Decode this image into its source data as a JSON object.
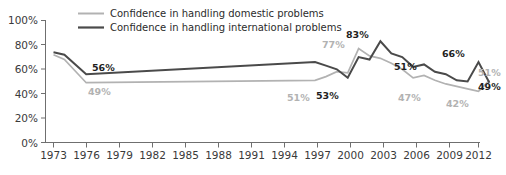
{
  "chart_data": {
    "type": "line",
    "title": "",
    "subtitle": "",
    "xlabel": "",
    "ylabel": "",
    "xlim": [
      1973,
      2013
    ],
    "ylim": [
      0,
      100
    ],
    "grid": false,
    "legend_position": "top-center",
    "ytick_labels": [
      "0%",
      "20%",
      "40%",
      "60%",
      "80%",
      "100%"
    ],
    "ytick_values": [
      0,
      20,
      40,
      60,
      80,
      100
    ],
    "xtick_labels": [
      "1973",
      "1976",
      "1979",
      "1982",
      "1985",
      "1988",
      "1991",
      "1994",
      "1997",
      "2000",
      "2003",
      "2006",
      "2009",
      "2012"
    ],
    "xtick_values": [
      1973,
      1976,
      1979,
      1982,
      1985,
      1988,
      1991,
      1994,
      1997,
      2000,
      2003,
      2006,
      2009,
      2012
    ],
    "series": [
      {
        "name": "Confidence in handling domestic problems",
        "color": "#b2b2b2",
        "x": [
          1973,
          1974,
          1976,
          1997,
          1998,
          1999,
          2000,
          2001,
          2002,
          2003,
          2004,
          2005,
          2006,
          2007,
          2008,
          2009,
          2010,
          2011,
          2012,
          2013
        ],
        "values": [
          72,
          68,
          49,
          51,
          54,
          58,
          57,
          77,
          71,
          69,
          65,
          60,
          53,
          55,
          51,
          48,
          46,
          44,
          42,
          51
        ]
      },
      {
        "name": "Confidence in handling international problems",
        "color": "#4a4a4a",
        "x": [
          1973,
          1974,
          1976,
          1997,
          1998,
          1999,
          2000,
          2001,
          2002,
          2003,
          2004,
          2005,
          2006,
          2007,
          2008,
          2009,
          2010,
          2011,
          2012,
          2013
        ],
        "values": [
          74,
          72,
          56,
          66,
          63,
          60,
          53,
          70,
          68,
          83,
          73,
          70,
          62,
          64,
          58,
          56,
          51,
          50,
          66,
          49
        ]
      }
    ],
    "annotations": [
      {
        "text": "56%",
        "series": "international",
        "year": 1976,
        "value": 56,
        "style": "dark"
      },
      {
        "text": "49%",
        "series": "domestic",
        "year": 1976,
        "value": 49,
        "style": "light"
      },
      {
        "text": "51%",
        "series": "domestic",
        "year": 1997,
        "value": 51,
        "style": "light"
      },
      {
        "text": "53%",
        "series": "international",
        "year": 2000,
        "value": 53,
        "style": "dark"
      },
      {
        "text": "77%",
        "series": "domestic",
        "year": 2001,
        "value": 77,
        "style": "light"
      },
      {
        "text": "83%",
        "series": "international",
        "year": 2003,
        "value": 83,
        "style": "dark"
      },
      {
        "text": "51%",
        "series": "international",
        "year": 2006,
        "value": 51,
        "style": "dark"
      },
      {
        "text": "47%",
        "series": "domestic",
        "year": 2008,
        "value": 47,
        "style": "light"
      },
      {
        "text": "66%",
        "series": "international",
        "year": 2012,
        "value": 66,
        "style": "dark"
      },
      {
        "text": "42%",
        "series": "domestic",
        "year": 2012,
        "value": 42,
        "style": "light"
      },
      {
        "text": "51%",
        "series": "domestic",
        "year": 2013,
        "value": 51,
        "style": "light"
      },
      {
        "text": "49%",
        "series": "international",
        "year": 2013,
        "value": 49,
        "style": "dark"
      }
    ]
  },
  "legend": {
    "items": [
      {
        "label": "Confidence in handling domestic problems",
        "color": "#b2b2b2"
      },
      {
        "label": "Confidence in handling international problems",
        "color": "#4a4a4a"
      }
    ]
  },
  "labels": {
    "y_100": "100%",
    "y_80": "80%",
    "y_60": "60%",
    "y_40": "40%",
    "y_20": "20%",
    "y_0": "0%",
    "x_1973": "1973",
    "x_1976": "1976",
    "x_1979": "1979",
    "x_1982": "1982",
    "x_1985": "1985",
    "x_1988": "1988",
    "x_1991": "1991",
    "x_1994": "1994",
    "x_1997": "1997",
    "x_2000": "2000",
    "x_2003": "2003",
    "x_2006": "2006",
    "x_2009": "2009",
    "x_2012": "2012",
    "a_56": "56%",
    "a_49_left": "49%",
    "a_51_mid": "51%",
    "a_53": "53%",
    "a_77": "77%",
    "a_83": "83%",
    "a_51_right": "51%",
    "a_47": "47%",
    "a_66": "66%",
    "a_42": "42%",
    "a_51_end": "51%",
    "a_49_end": "49%"
  }
}
